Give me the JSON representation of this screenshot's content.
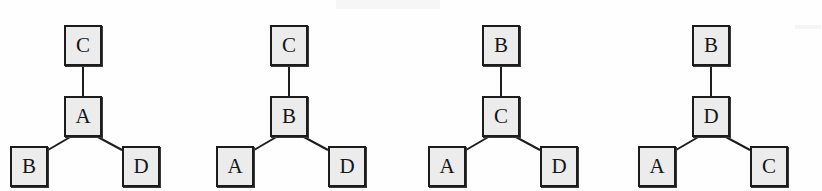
{
  "figure": {
    "title": "",
    "box_fill_color": "#ececed",
    "box_border_color": "#1c1c1c",
    "edge_color": "#1d1d1d",
    "background_color": "#ffffff"
  },
  "trees": [
    {
      "id": "tree-1",
      "root": "C",
      "middle": "A",
      "leaf_left": "B",
      "leaf_right": "D"
    },
    {
      "id": "tree-2",
      "root": "C",
      "middle": "B",
      "leaf_left": "A",
      "leaf_right": "D"
    },
    {
      "id": "tree-3",
      "root": "B",
      "middle": "C",
      "leaf_left": "A",
      "leaf_right": "D"
    },
    {
      "id": "tree-4",
      "root": "B",
      "middle": "D",
      "leaf_left": "A",
      "leaf_right": "C"
    }
  ]
}
